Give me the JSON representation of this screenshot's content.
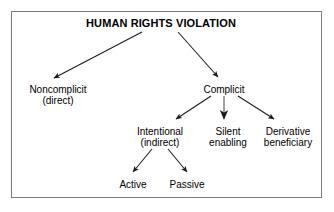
{
  "diagram": {
    "title_node": {
      "id": "human-rights-violation",
      "lines": [
        "HUMAN RIGHTS VIOLATION"
      ]
    },
    "nodes": [
      {
        "id": "noncomplicit",
        "lines": [
          "Noncomplicit",
          "(direct)"
        ]
      },
      {
        "id": "complicit",
        "lines": [
          "Complicit"
        ]
      },
      {
        "id": "intentional",
        "lines": [
          "Intentional",
          "(indirect)"
        ]
      },
      {
        "id": "silent-enabling",
        "lines": [
          "Silent",
          "enabling"
        ]
      },
      {
        "id": "derivative-beneficiary",
        "lines": [
          "Derivative",
          "beneficiary"
        ]
      },
      {
        "id": "active",
        "lines": [
          "Active"
        ]
      },
      {
        "id": "passive",
        "lines": [
          "Passive"
        ]
      }
    ],
    "edges": [
      {
        "from": "human-rights-violation",
        "to": "noncomplicit"
      },
      {
        "from": "human-rights-violation",
        "to": "complicit"
      },
      {
        "from": "complicit",
        "to": "intentional"
      },
      {
        "from": "complicit",
        "to": "silent-enabling"
      },
      {
        "from": "complicit",
        "to": "derivative-beneficiary"
      },
      {
        "from": "intentional",
        "to": "active"
      },
      {
        "from": "intentional",
        "to": "passive"
      }
    ],
    "colors": {
      "background": "#ffffff",
      "border": "#7b7b7b",
      "text": "#000000",
      "edge": "#1a1a1a"
    }
  }
}
